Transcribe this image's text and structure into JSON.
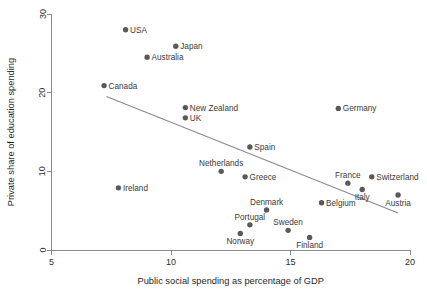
{
  "chart_data": {
    "type": "scatter",
    "title": "",
    "xlabel": "Public social spending as percentage of GDP",
    "ylabel": "Private share of education spending",
    "xlim": [
      5,
      20
    ],
    "ylim": [
      0,
      30
    ],
    "xticks": [
      5,
      10,
      15,
      20
    ],
    "yticks": [
      0,
      10,
      20,
      30
    ],
    "xtick_labels": [
      "5",
      "10",
      "15",
      "20"
    ],
    "ytick_labels": [
      "0",
      "10",
      "20",
      "30"
    ],
    "grid": false,
    "legend": "none",
    "marker_color": "#59595b",
    "trend_line_color": "#8a8a8a",
    "trendline": {
      "label": "linear fit",
      "x_start": 7.3,
      "y_start": 19.5,
      "x_end": 19.5,
      "y_end": 4.7
    },
    "points": [
      {
        "label": "USA",
        "x": 8.1,
        "y": 28.0,
        "label_pos": "right"
      },
      {
        "label": "Japan",
        "x": 10.2,
        "y": 25.9,
        "label_pos": "right"
      },
      {
        "label": "Australia",
        "x": 9.0,
        "y": 24.5,
        "label_pos": "right"
      },
      {
        "label": "Canada",
        "x": 7.2,
        "y": 20.9,
        "label_pos": "right"
      },
      {
        "label": "New Zealand",
        "x": 10.6,
        "y": 18.1,
        "label_pos": "right"
      },
      {
        "label": "UK",
        "x": 10.6,
        "y": 16.8,
        "label_pos": "right"
      },
      {
        "label": "Germany",
        "x": 17.0,
        "y": 18.0,
        "label_pos": "right"
      },
      {
        "label": "Spain",
        "x": 13.3,
        "y": 13.1,
        "label_pos": "right"
      },
      {
        "label": "Netherlands",
        "x": 12.1,
        "y": 10.0,
        "label_pos": "above"
      },
      {
        "label": "Greece",
        "x": 13.1,
        "y": 9.3,
        "label_pos": "right"
      },
      {
        "label": "Switzerland",
        "x": 18.4,
        "y": 9.3,
        "label_pos": "right"
      },
      {
        "label": "France",
        "x": 17.4,
        "y": 8.5,
        "label_pos": "above"
      },
      {
        "label": "Italy",
        "x": 18.0,
        "y": 7.7,
        "label_pos": "below"
      },
      {
        "label": "Austria",
        "x": 19.5,
        "y": 7.0,
        "label_pos": "below"
      },
      {
        "label": "Ireland",
        "x": 7.8,
        "y": 7.9,
        "label_pos": "right"
      },
      {
        "label": "Belgium",
        "x": 16.3,
        "y": 6.0,
        "label_pos": "right"
      },
      {
        "label": "Denmark",
        "x": 14.0,
        "y": 5.1,
        "label_pos": "above"
      },
      {
        "label": "Portugal",
        "x": 13.3,
        "y": 3.2,
        "label_pos": "above"
      },
      {
        "label": "Sweden",
        "x": 14.9,
        "y": 2.5,
        "label_pos": "above"
      },
      {
        "label": "Norway",
        "x": 12.9,
        "y": 2.1,
        "label_pos": "below"
      },
      {
        "label": "Finland",
        "x": 15.8,
        "y": 1.6,
        "label_pos": "below"
      }
    ]
  }
}
